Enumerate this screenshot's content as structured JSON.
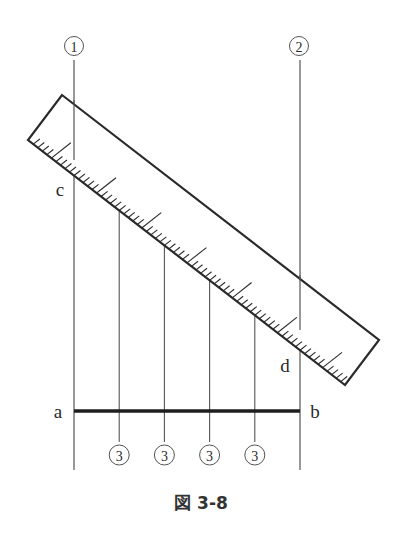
{
  "figure": {
    "caption": "図 3-8",
    "colors": {
      "ink": "#2a2a2a",
      "thin_line": "#555555",
      "bar": "#1e1e1e"
    }
  },
  "labels": {
    "line1": "①",
    "line2": "②",
    "division_marks": [
      "③",
      "③",
      "③",
      "③"
    ],
    "point_a": "a",
    "point_b": "b",
    "point_c": "c",
    "point_d": "d"
  },
  "construction": {
    "description": "Dividing segment a–b into equal parts using a slanted ruler between perpendiculars ① and ②",
    "segment": "a-b",
    "divisions": 5,
    "ruler_ends": [
      "c",
      "d"
    ]
  }
}
